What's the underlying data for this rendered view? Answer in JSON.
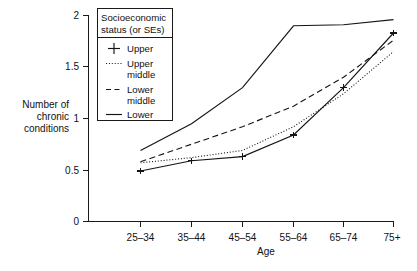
{
  "chart_data": {
    "type": "line",
    "title": "",
    "xlabel": "Age",
    "ylabel": "Number of chronic conditions",
    "ylabel_lines": [
      "Number of",
      "chronic",
      "conditions"
    ],
    "categories": [
      "25–34",
      "35–44",
      "45–54",
      "55–64",
      "65–74",
      "75+"
    ],
    "ylim": [
      0,
      2
    ],
    "yticks": [
      "0",
      "0.5",
      "1",
      "1.5",
      "2"
    ],
    "ytick_values": [
      0,
      0.5,
      1,
      1.5,
      2
    ],
    "grid": false,
    "legend_position": "top-left-inside",
    "series": [
      {
        "name": "Upper",
        "style": "solid-with-plus-markers",
        "marker": "plus",
        "values": [
          0.49,
          0.59,
          0.63,
          0.84,
          1.3,
          1.83
        ]
      },
      {
        "name": "Upper middle",
        "style": "dotted",
        "marker": "none",
        "values": [
          0.57,
          0.62,
          0.69,
          0.92,
          1.24,
          1.65
        ]
      },
      {
        "name": "Lower middle",
        "style": "dashed",
        "marker": "none",
        "values": [
          0.58,
          0.75,
          0.92,
          1.12,
          1.4,
          1.76
        ]
      },
      {
        "name": "Lower",
        "style": "solid",
        "marker": "none",
        "values": [
          0.69,
          0.95,
          1.3,
          1.9,
          1.91,
          1.96
        ]
      }
    ]
  },
  "legend": {
    "title_lines": [
      "Socioeconomic",
      "status (or SEs)"
    ],
    "title": "Socioeconomic status (or SEs)",
    "entries": [
      {
        "label_lines": [
          "Upper"
        ],
        "label": "Upper",
        "sample": "plus-marker"
      },
      {
        "label_lines": [
          "Upper",
          "middle"
        ],
        "label": "Upper middle",
        "sample": "dotted-line"
      },
      {
        "label_lines": [
          "Lower",
          "middle"
        ],
        "label": "Lower middle",
        "sample": "dashed-line"
      },
      {
        "label_lines": [
          "Lower"
        ],
        "label": "Lower",
        "sample": "solid-line"
      }
    ]
  },
  "colors": {
    "ink": "#141414",
    "background": "#ffffff"
  }
}
